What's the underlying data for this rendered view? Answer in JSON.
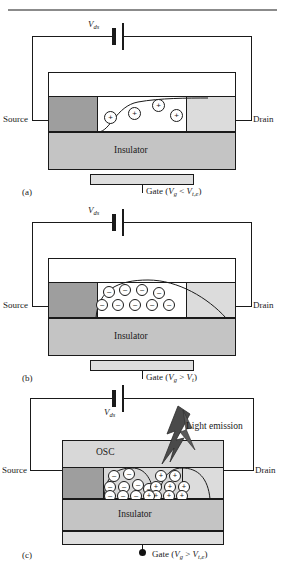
{
  "figure": {
    "running_head": ""
  },
  "colors": {
    "source_electrode": "#9e9e9e",
    "drain_electrode": "#dcdcdc",
    "insulator": "#c4c4c4",
    "osc_layer": "#d8d8d8",
    "gate_contact": "#dedede",
    "channel": "#ffffff",
    "outline": "#1a1a1a",
    "lightning": "#4a4a4a"
  },
  "panels": [
    {
      "id": "a",
      "panel_label": "(a)",
      "bias_label": "V",
      "bias_sub": "ds",
      "source_label": "Source",
      "drain_label": "Drain",
      "insulator_label": "Insulator",
      "gate_label": "Gate (",
      "gate_v": "V",
      "gate_v_sub": "g",
      "gate_rel": " < ",
      "gate_vt": "V",
      "gate_vt_sub": "t,e",
      "gate_close": ")",
      "carrier_sign": "+",
      "carrier_type": "holes",
      "carrier_count": 4,
      "regime": "hole accumulation below electron threshold"
    },
    {
      "id": "b",
      "panel_label": "(b)",
      "bias_label": "V",
      "bias_sub": "ds",
      "source_label": "Source",
      "drain_label": "Drain",
      "insulator_label": "Insulator",
      "gate_label": "Gate (",
      "gate_v": "V",
      "gate_v_sub": "g",
      "gate_rel": " > ",
      "gate_vt": "V",
      "gate_vt_sub": "t",
      "gate_close": ")",
      "carrier_sign": "–",
      "carrier_type": "electrons",
      "carrier_count": 9,
      "regime": "electron accumulation above threshold"
    },
    {
      "id": "c",
      "panel_label": "(c)",
      "bias_label": "V",
      "bias_sub": "ds",
      "source_label": "Source",
      "drain_label": "Drain",
      "insulator_label": "Insulator",
      "osc_label": "OSC",
      "emission_label": "Light emission",
      "gate_label": "Gate (",
      "gate_v": "V",
      "gate_v_sub": "g",
      "gate_rel": " > ",
      "gate_vt": "V",
      "gate_vt_sub": "t,e",
      "gate_close": ")",
      "electron_sign": "–",
      "hole_sign": "+",
      "electron_count": 9,
      "hole_count": 9,
      "regime": "ambipolar recombination with light emission"
    }
  ]
}
